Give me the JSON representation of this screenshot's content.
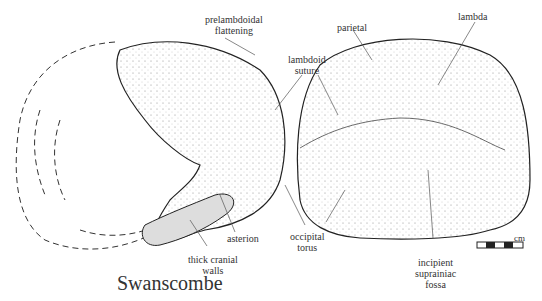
{
  "title": "Swanscombe",
  "labels": {
    "prelambdoidal": [
      "prelambdoidal",
      "flattening"
    ],
    "parietal": "parietal",
    "lambda": "lambda",
    "lambdoid": [
      "lambdoid",
      "suture"
    ],
    "asterion": "asterion",
    "thick": [
      "thick cranial",
      "walls"
    ],
    "occipital": [
      "occipital",
      "torus"
    ],
    "incipient": [
      "incipient",
      "suprainiac",
      "fossa"
    ]
  },
  "scale_bar": {
    "unit": "cm"
  }
}
